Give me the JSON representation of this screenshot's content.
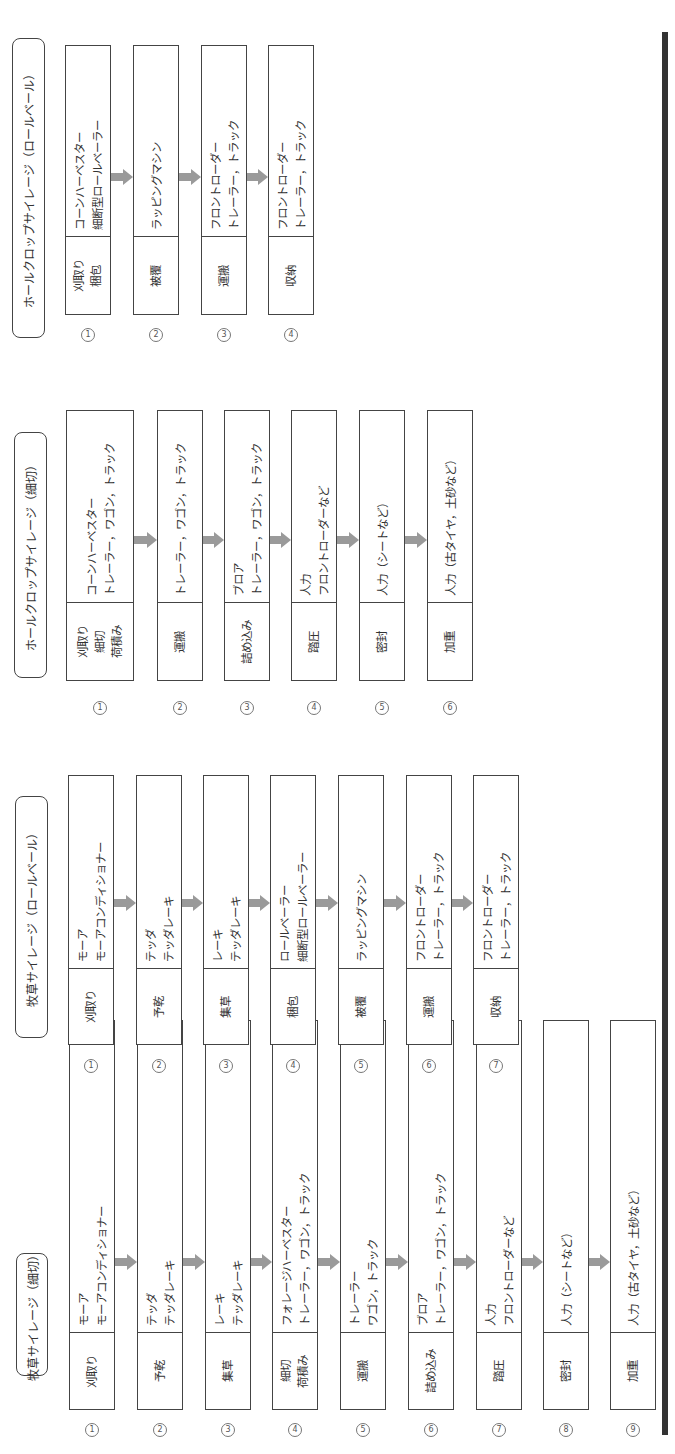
{
  "colors": {
    "line": "#444444",
    "text": "#333333",
    "arrow": "#9a9a9a",
    "bar": "#333333"
  },
  "sections": [
    {
      "title": "牧草サイレージ（細切）",
      "steps": [
        {
          "num": "①",
          "label": [
            "刈取り"
          ],
          "detail": [
            "モーア",
            "モーアコンディショナー"
          ]
        },
        {
          "num": "②",
          "label": [
            "予乾"
          ],
          "detail": [
            "テッダ",
            "テッダレーキ"
          ]
        },
        {
          "num": "③",
          "label": [
            "集草"
          ],
          "detail": [
            "レーキ",
            "テッダレーキ"
          ]
        },
        {
          "num": "④",
          "label": [
            "細切",
            "荷積み"
          ],
          "detail": [
            "フォレージハーベスター",
            "トレーラー，ワゴン，トラック"
          ]
        },
        {
          "num": "⑤",
          "label": [
            "運搬"
          ],
          "detail": [
            "トレーラー",
            "ワゴン，トラック"
          ]
        },
        {
          "num": "⑥",
          "label": [
            "詰め込み"
          ],
          "detail": [
            "ブロア",
            "トレーラー，ワゴン，トラック"
          ]
        },
        {
          "num": "⑦",
          "label": [
            "踏圧"
          ],
          "detail": [
            "人力",
            "フロントローダーなど"
          ]
        },
        {
          "num": "⑧",
          "label": [
            "密封"
          ],
          "detail": [
            "人力（シートなど）"
          ]
        },
        {
          "num": "⑨",
          "label": [
            "加重"
          ],
          "detail": [
            "人力（古タイヤ，土砂など）"
          ]
        }
      ]
    },
    {
      "title": "牧草サイレージ（ロールベール）",
      "steps": [
        {
          "num": "①",
          "label": [
            "刈取り"
          ],
          "detail": [
            "モーア",
            "モーアコンディショナー"
          ]
        },
        {
          "num": "②",
          "label": [
            "予乾"
          ],
          "detail": [
            "テッダ",
            "テッダレーキ"
          ]
        },
        {
          "num": "③",
          "label": [
            "集草"
          ],
          "detail": [
            "レーキ",
            "テッダレーキ"
          ]
        },
        {
          "num": "④",
          "label": [
            "梱包"
          ],
          "detail": [
            "ロールベーラー",
            "細断型ロールベーラー"
          ]
        },
        {
          "num": "⑤",
          "label": [
            "被覆"
          ],
          "detail": [
            "ラッピングマシン"
          ]
        },
        {
          "num": "⑥",
          "label": [
            "運搬"
          ],
          "detail": [
            "フロントローダー",
            "トレーラー，トラック"
          ]
        },
        {
          "num": "⑦",
          "label": [
            "収納"
          ],
          "detail": [
            "フロントローダー",
            "トレーラー，トラック"
          ]
        }
      ]
    },
    {
      "title": "ホールクロップサイレージ（細切）",
      "steps": [
        {
          "num": "①",
          "label": [
            "刈取り",
            "細切",
            "荷積み"
          ],
          "detail": [
            "コーンハーベスター",
            "トレーラー，ワゴン，トラック"
          ]
        },
        {
          "num": "②",
          "label": [
            "運搬"
          ],
          "detail": [
            "トレーラー，ワゴン，トラック"
          ]
        },
        {
          "num": "③",
          "label": [
            "詰め込み"
          ],
          "detail": [
            "ブロア",
            "トレーラー，ワゴン，トラック"
          ]
        },
        {
          "num": "④",
          "label": [
            "踏圧"
          ],
          "detail": [
            "人力",
            "フロントローダーなど"
          ]
        },
        {
          "num": "⑤",
          "label": [
            "密封"
          ],
          "detail": [
            "人力（シートなど）"
          ]
        },
        {
          "num": "⑥",
          "label": [
            "加重"
          ],
          "detail": [
            "人力（古タイヤ，土砂など）"
          ]
        }
      ]
    },
    {
      "title": "ホールクロップサイレージ（ロールベール）",
      "steps": [
        {
          "num": "①",
          "label": [
            "刈取り",
            "梱包"
          ],
          "detail": [
            "コーンハーベスター",
            "細断型ロールベーラー"
          ]
        },
        {
          "num": "②",
          "label": [
            "被覆"
          ],
          "detail": [
            "ラッピングマシン"
          ]
        },
        {
          "num": "③",
          "label": [
            "運搬"
          ],
          "detail": [
            "フロントローダー",
            "トレーラー，トラック"
          ]
        },
        {
          "num": "④",
          "label": [
            "収納"
          ],
          "detail": [
            "フロントローダー",
            "トレーラー，トラック"
          ]
        }
      ]
    }
  ]
}
